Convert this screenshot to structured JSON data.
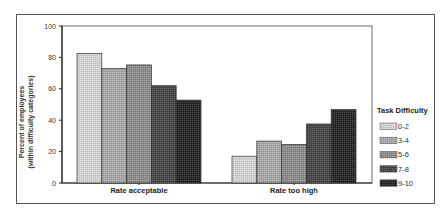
{
  "chart_data": {
    "type": "bar",
    "title": "",
    "xlabel": "",
    "ylabel": "Percent of employees (within difficulty categories)",
    "ylabel_lines": [
      "Percent of employees",
      "(within difficulty categories)"
    ],
    "ylim": [
      0,
      100
    ],
    "yticks": [
      0,
      20,
      40,
      60,
      80,
      100
    ],
    "grid": false,
    "legend_position": "right",
    "legend_title": "Task Difficulty",
    "categories": [
      "Rate acceptable",
      "Rate too high"
    ],
    "series": [
      {
        "name": "0-2",
        "color": "#d4d4d4",
        "values": [
          82.5,
          17.1
        ]
      },
      {
        "name": "3-4",
        "color": "#a8a8a8",
        "values": [
          72.9,
          26.7
        ]
      },
      {
        "name": "5-6",
        "color": "#8c8c8c",
        "values": [
          75.2,
          24.6
        ]
      },
      {
        "name": "7-8",
        "color": "#474747",
        "values": [
          62.0,
          37.6
        ]
      },
      {
        "name": "9-10",
        "color": "#262626",
        "values": [
          52.8,
          46.8
        ]
      }
    ]
  }
}
